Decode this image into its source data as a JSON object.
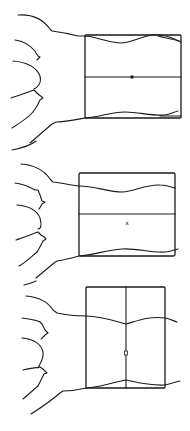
{
  "figure": {
    "width": 190,
    "height": 431,
    "stroke_color": "#1a1a1a",
    "background": "#ffffff",
    "panels": [
      {
        "id": "panel-1",
        "rect": {
          "x": 85,
          "y": 35,
          "w": 96,
          "h": 83
        },
        "divider": "horizontal",
        "divider_pos": 77,
        "marker": {
          "label": "x",
          "x": 132,
          "y": 79,
          "style": "filled-square"
        }
      },
      {
        "id": "panel-2",
        "rect": {
          "x": 79,
          "y": 173,
          "w": 96,
          "h": 83
        },
        "divider": "horizontal",
        "divider_pos": 214,
        "marker": {
          "label": "x",
          "x": 127,
          "y": 225,
          "style": "text"
        }
      },
      {
        "id": "panel-3",
        "rect": {
          "x": 86,
          "y": 287,
          "w": 79,
          "h": 101
        },
        "divider": "vertical",
        "divider_pos": 126,
        "marker": {
          "label": "z",
          "x": 126,
          "y": 355,
          "style": "text"
        }
      }
    ]
  }
}
